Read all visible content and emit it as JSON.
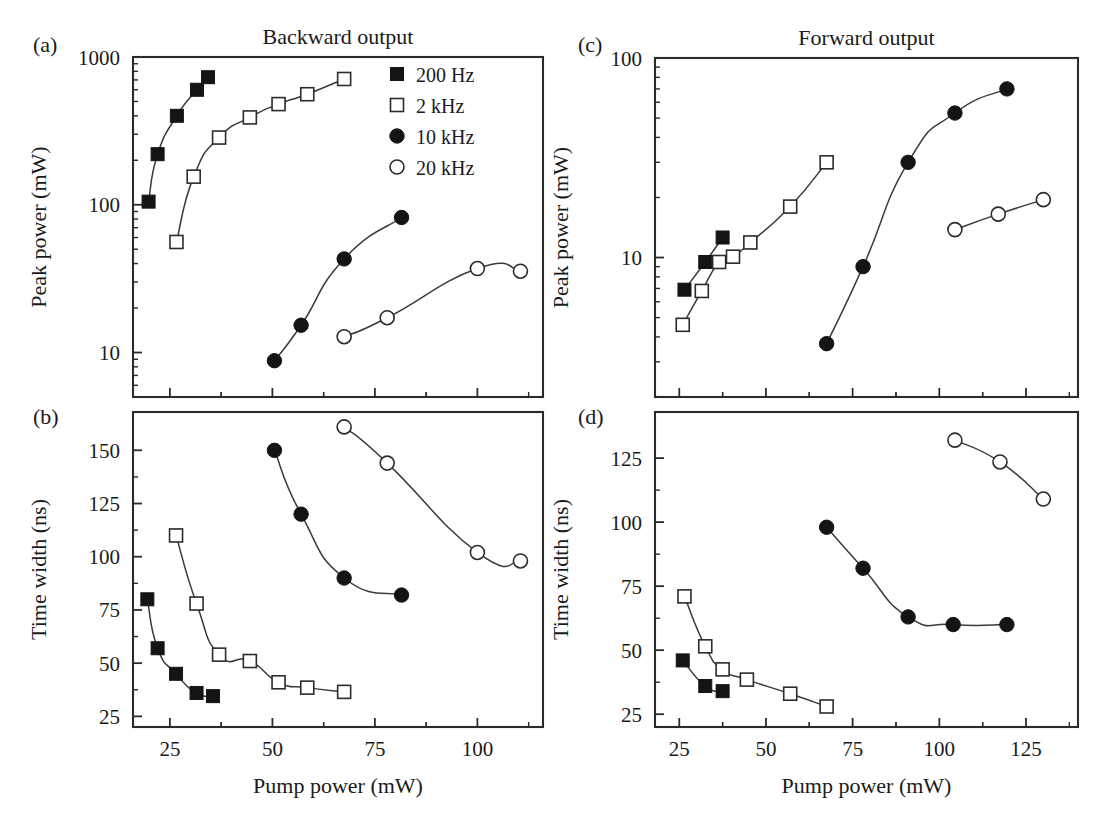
{
  "figure": {
    "column_titles": {
      "left": "Backward output",
      "right": "Forward output"
    },
    "panel_labels": {
      "a": "(a)",
      "b": "(b)",
      "c": "(c)",
      "d": "(d)"
    },
    "legend": {
      "entries": [
        {
          "label": "200 Hz",
          "marker": "filled-square"
        },
        {
          "label": "2 kHz",
          "marker": "open-square"
        },
        {
          "label": "10 kHz",
          "marker": "filled-circle"
        },
        {
          "label": "20 kHz",
          "marker": "open-circle"
        }
      ]
    },
    "series_colors": {
      "marker_fill": "#141414",
      "marker_edge": "#2b2b2b",
      "curve": "#3a3a3a",
      "frame": "#2b2b2b"
    }
  },
  "chart_data": [
    {
      "id": "panel-a",
      "type": "scatter",
      "panel": "(a)",
      "title": "Backward output",
      "xlabel": "",
      "ylabel": "Peak power (mW)",
      "yscale": "log",
      "xscale": "linear",
      "xlim": [
        16,
        116
      ],
      "ylim": [
        5,
        1000
      ],
      "xticks": [
        25,
        50,
        75,
        100
      ],
      "xticklabels": [
        "",
        "",
        "",
        ""
      ],
      "yticks": [
        10,
        100,
        1000
      ],
      "yticklabels": [
        "10",
        "100",
        "1000"
      ],
      "grid": false,
      "legend_position": "top-right",
      "series": [
        {
          "name": "200 Hz",
          "marker": "filled-square",
          "x": [
            19.8,
            22.0,
            26.7,
            31.6,
            34.3
          ],
          "y": [
            105,
            220,
            400,
            600,
            730
          ]
        },
        {
          "name": "2 kHz",
          "marker": "open-square",
          "x": [
            26.6,
            30.8,
            37.0,
            44.5,
            51.5,
            58.5,
            67.5
          ],
          "y": [
            56,
            155,
            285,
            390,
            480,
            560,
            710
          ]
        },
        {
          "name": "10 kHz",
          "marker": "filled-circle",
          "x": [
            50.5,
            57.0,
            67.5,
            81.5
          ],
          "y": [
            8.8,
            15.3,
            43,
            82
          ]
        },
        {
          "name": "20 kHz",
          "marker": "open-circle",
          "x": [
            67.5,
            78.0,
            100.0,
            110.5
          ],
          "y": [
            12.8,
            17.2,
            37,
            35.5
          ]
        }
      ]
    },
    {
      "id": "panel-b",
      "type": "scatter",
      "panel": "(b)",
      "title": "",
      "xlabel": "Pump power (mW)",
      "ylabel": "Time width (ns)",
      "yscale": "linear",
      "xscale": "linear",
      "xlim": [
        16,
        116
      ],
      "ylim": [
        20,
        168
      ],
      "xticks": [
        25,
        50,
        75,
        100
      ],
      "xticklabels": [
        "25",
        "50",
        "75",
        "100"
      ],
      "yticks": [
        25,
        50,
        75,
        100,
        125,
        150
      ],
      "yticklabels": [
        "25",
        "50",
        "75",
        "100",
        "125",
        "150"
      ],
      "grid": false,
      "legend_position": "none",
      "series": [
        {
          "name": "200 Hz",
          "marker": "filled-square",
          "x": [
            19.5,
            22.0,
            26.5,
            31.5,
            35.5
          ],
          "y": [
            80,
            57,
            45,
            36,
            34.5
          ]
        },
        {
          "name": "2 kHz",
          "marker": "open-square",
          "x": [
            26.5,
            31.5,
            37.0,
            44.5,
            51.5,
            58.5,
            67.5
          ],
          "y": [
            110,
            78,
            54,
            51,
            41,
            38.5,
            36.5
          ]
        },
        {
          "name": "10 kHz",
          "marker": "filled-circle",
          "x": [
            50.5,
            57.0,
            67.5,
            81.5
          ],
          "y": [
            150,
            120,
            90,
            82
          ]
        },
        {
          "name": "20 kHz",
          "marker": "open-circle",
          "x": [
            67.5,
            78.0,
            100.0,
            110.5
          ],
          "y": [
            161,
            144,
            102,
            98
          ]
        }
      ]
    },
    {
      "id": "panel-c",
      "type": "scatter",
      "panel": "(c)",
      "title": "Forward output",
      "xlabel": "",
      "ylabel": "Peak power (mW)",
      "yscale": "log",
      "xscale": "linear",
      "xlim": [
        18,
        140
      ],
      "ylim": [
        2,
        100
      ],
      "xticks": [
        25,
        50,
        75,
        100,
        125
      ],
      "xticklabels": [
        "",
        "",
        "",
        "",
        ""
      ],
      "yticks": [
        10,
        100
      ],
      "yticklabels": [
        "10",
        "100"
      ],
      "grid": false,
      "legend_position": "none",
      "series": [
        {
          "name": "200 Hz",
          "marker": "filled-square",
          "x": [
            26.5,
            32.5,
            37.5
          ],
          "y": [
            6.9,
            9.5,
            12.6
          ]
        },
        {
          "name": "2 kHz",
          "marker": "open-square",
          "x": [
            26.0,
            31.5,
            36.5,
            40.5,
            45.5,
            57.0,
            67.5
          ],
          "y": [
            4.6,
            6.8,
            9.5,
            10.1,
            11.9,
            18.0,
            30.0
          ]
        },
        {
          "name": "10 kHz",
          "marker": "filled-circle",
          "x": [
            67.5,
            78.0,
            91.0,
            104.5,
            119.5
          ],
          "y": [
            3.7,
            9.0,
            30.0,
            53.0,
            70.0
          ]
        },
        {
          "name": "20 kHz",
          "marker": "open-circle",
          "x": [
            104.5,
            117.0,
            130.0
          ],
          "y": [
            13.8,
            16.5,
            19.5
          ]
        }
      ]
    },
    {
      "id": "panel-d",
      "type": "scatter",
      "panel": "(d)",
      "title": "",
      "xlabel": "Pump power (mW)",
      "ylabel": "Time width (ns)",
      "yscale": "linear",
      "xscale": "linear",
      "xlim": [
        18,
        140
      ],
      "ylim": [
        20,
        143
      ],
      "xticks": [
        25,
        50,
        75,
        100,
        125
      ],
      "xticklabels": [
        "25",
        "50",
        "75",
        "100",
        "125"
      ],
      "yticks": [
        25,
        50,
        75,
        100,
        125
      ],
      "yticklabels": [
        "25",
        "50",
        "75",
        "100",
        "125"
      ],
      "grid": false,
      "legend_position": "none",
      "series": [
        {
          "name": "200 Hz",
          "marker": "filled-square",
          "x": [
            26.0,
            32.5,
            37.5
          ],
          "y": [
            46,
            36,
            34
          ]
        },
        {
          "name": "2 kHz",
          "marker": "open-square",
          "x": [
            26.5,
            32.5,
            37.5,
            44.5,
            57.0,
            67.5
          ],
          "y": [
            71,
            51.5,
            42.5,
            38.5,
            33,
            28
          ]
        },
        {
          "name": "10 kHz",
          "marker": "filled-circle",
          "x": [
            67.5,
            78.0,
            91.0,
            104.0,
            119.5
          ],
          "y": [
            98,
            82,
            63,
            60,
            60
          ]
        },
        {
          "name": "20 kHz",
          "marker": "open-circle",
          "x": [
            104.5,
            117.5,
            130.0
          ],
          "y": [
            132,
            123.5,
            109
          ]
        }
      ]
    }
  ]
}
